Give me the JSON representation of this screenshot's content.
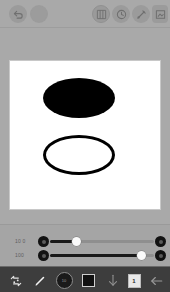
{
  "app": {
    "title": "Drawing Canvas"
  },
  "top_bar": {
    "items": [
      {
        "name": "undo-button",
        "icon": "undo-icon",
        "label": "Undo"
      },
      {
        "name": "color-swatch",
        "icon": "circle-icon",
        "label": "Color"
      },
      {
        "name": "layers-button",
        "icon": "layers-icon",
        "label": "Layers"
      },
      {
        "name": "history-button",
        "icon": "history-icon",
        "label": "History"
      },
      {
        "name": "pen-button",
        "icon": "pen-icon",
        "label": "Pen"
      },
      {
        "name": "export-button",
        "icon": "export-icon",
        "label": "Export"
      }
    ]
  },
  "canvas": {
    "background": "#ffffff",
    "shapes": [
      {
        "name": "filled-ellipse",
        "type": "ellipse",
        "fill": "#000000",
        "stroke": "none",
        "label": "Filled ellipse"
      },
      {
        "name": "outline-ellipse",
        "type": "ellipse",
        "fill": "none",
        "stroke": "#000000",
        "label": "Outline ellipse"
      }
    ]
  },
  "sliders": [
    {
      "name": "opacity-slider",
      "label": "10 0",
      "value": 25,
      "min": 0,
      "max": 100,
      "fill_color": "#191919"
    },
    {
      "name": "size-slider",
      "label": "100",
      "value": 88,
      "min": 0,
      "max": 100,
      "fill_color": "#191919"
    }
  ],
  "bottom_bar": {
    "items": [
      {
        "name": "transform-tool",
        "icon": "transform-icon",
        "label": "Transform"
      },
      {
        "name": "brush-tool",
        "icon": "brush-icon",
        "label": "Brush"
      },
      {
        "name": "size-tool",
        "icon": "size-icon",
        "label": "Size",
        "value": "10"
      },
      {
        "name": "color-tool",
        "icon": "square-icon",
        "label": "Color"
      },
      {
        "name": "import-tool",
        "icon": "arrow-down-icon",
        "label": "Import"
      },
      {
        "name": "page-tool",
        "icon": "page-icon",
        "label": "Page",
        "value": "1"
      },
      {
        "name": "back-button",
        "icon": "arrow-left-icon",
        "label": "Back"
      }
    ]
  },
  "colors": {
    "chrome": "#a9a9a9",
    "panel": "#a5a5a5",
    "toolbar": "#3d3d3d",
    "canvas": "#ffffff",
    "ink": "#000000"
  }
}
